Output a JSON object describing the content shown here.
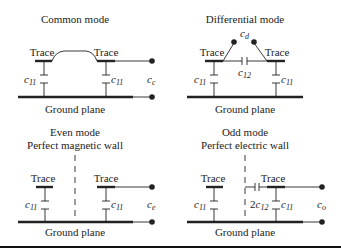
{
  "panels": {
    "common": {
      "title": "Common mode",
      "trace_left": "Trace",
      "trace_right": "Trace",
      "cap_left": {
        "main": "c",
        "sub": "11"
      },
      "cap_right": {
        "main": "c",
        "sub": "11"
      },
      "port": {
        "main": "c",
        "sub": "c"
      },
      "ground": "Ground plane"
    },
    "differential": {
      "title": "Differential mode",
      "trace_left": "Trace",
      "trace_right": "Trace",
      "cap_left": {
        "main": "c",
        "sub": "11"
      },
      "cap_right": {
        "main": "c",
        "sub": "11"
      },
      "cap_mutual": {
        "main": "c",
        "sub": "12"
      },
      "port": {
        "main": "c",
        "sub": "d"
      },
      "ground": "Ground plane"
    },
    "even": {
      "title": "Even mode",
      "subtitle": "Perfect magnetic wall",
      "trace_left": "Trace",
      "trace_right": "Trace",
      "cap_left": {
        "main": "c",
        "sub": "11"
      },
      "cap_right": {
        "main": "c",
        "sub": "11"
      },
      "port": {
        "main": "c",
        "sub": "e"
      },
      "ground": "Ground plane"
    },
    "odd": {
      "title": "Odd mode",
      "subtitle": "Perfect electric wall",
      "trace_left": "Trace",
      "trace_right": "Trace",
      "cap_left": {
        "main": "c",
        "sub": "11"
      },
      "cap_right": {
        "main": "c",
        "sub": "11"
      },
      "cap_mutual": {
        "prefix": "2",
        "main": "c",
        "sub": "12"
      },
      "port": {
        "main": "c",
        "sub": "o"
      },
      "ground": "Ground plane"
    }
  },
  "colors": {
    "ink": "#222222",
    "background": "#ffffff"
  }
}
